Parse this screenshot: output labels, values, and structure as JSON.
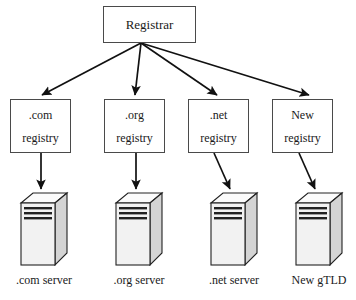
{
  "diagram": {
    "type": "tree-diagram",
    "root": {
      "label": "Registrar"
    },
    "registries": [
      {
        "line1": ".com",
        "line2": "registry"
      },
      {
        "line1": ".org",
        "line2": "registry"
      },
      {
        "line1": ".net",
        "line2": "registry"
      },
      {
        "line1": "New",
        "line2": "registry"
      }
    ],
    "servers": [
      {
        "icon": "server-tower-icon",
        "caption": ".com server"
      },
      {
        "icon": "server-tower-icon",
        "caption": ".org server"
      },
      {
        "icon": "server-tower-icon",
        "caption": ".net server"
      },
      {
        "icon": "server-tower-icon",
        "caption": "New gTLD"
      }
    ],
    "colors": {
      "background": "#ffffff",
      "stroke": "#4a4a4a",
      "arrow": "#111111",
      "text": "#1a1a1a",
      "server_front": "#f2f2f2",
      "server_side": "#d4d4d4",
      "server_top": "#fbfbfb",
      "server_slot": "#222222"
    }
  }
}
